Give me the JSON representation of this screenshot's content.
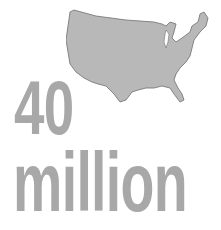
{
  "graphic": {
    "map_label": "United States map silhouette",
    "number": "40",
    "unit": "million"
  },
  "colors": {
    "text": "#a8a8a8",
    "map_fill": "#b8b8b8",
    "map_outline": "#6e6e6e",
    "background": "#ffffff"
  }
}
